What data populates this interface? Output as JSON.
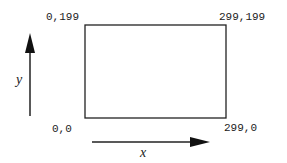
{
  "diagram": {
    "type": "coordinate-system",
    "corners": {
      "top_left": "0,199",
      "top_right": "299,199",
      "bottom_left": "0,0",
      "bottom_right": "299,0"
    },
    "axes": {
      "x_label": "x",
      "y_label": "y"
    },
    "colors": {
      "stroke": "#222222",
      "background": "#ffffff"
    }
  }
}
